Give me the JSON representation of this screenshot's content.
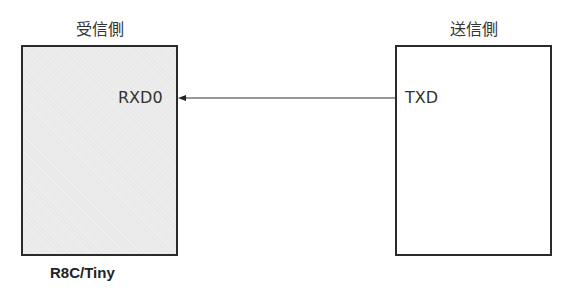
{
  "receiver": {
    "title": "受信側",
    "pin": "RXD0",
    "device_label": "R8C/Tiny",
    "fill_color": "#e9e9e9"
  },
  "transmitter": {
    "title": "送信側",
    "pin": "TXD",
    "fill_color": "#ffffff"
  },
  "signal": {
    "direction": "transmitter-to-receiver",
    "from": "TXD",
    "to": "RXD0"
  }
}
